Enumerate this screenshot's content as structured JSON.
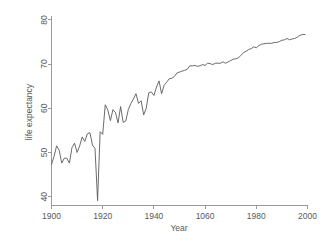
{
  "chart_data": {
    "type": "line",
    "title": "",
    "xlabel": "Year",
    "ylabel": "life expectancy",
    "xlim": [
      1900,
      2000
    ],
    "ylim": [
      38,
      81
    ],
    "grid": false,
    "legend": null,
    "xticks": [
      1900,
      1920,
      1940,
      1960,
      1980,
      2000
    ],
    "xticklabels": [
      "1900",
      "1920",
      "1940",
      "1060",
      "1980",
      "2000"
    ],
    "yticks": [
      40,
      50,
      60,
      70,
      80
    ],
    "yticklabels": [
      "40",
      "50",
      "60",
      "70",
      "80"
    ],
    "series": [
      {
        "name": "life expectancy",
        "color": "#5a5a5a",
        "x": [
          1900,
          1901,
          1902,
          1903,
          1904,
          1905,
          1906,
          1907,
          1908,
          1909,
          1910,
          1911,
          1912,
          1913,
          1914,
          1915,
          1916,
          1917,
          1918,
          1919,
          1920,
          1921,
          1922,
          1923,
          1924,
          1925,
          1926,
          1927,
          1928,
          1929,
          1930,
          1931,
          1932,
          1933,
          1934,
          1935,
          1936,
          1937,
          1938,
          1939,
          1940,
          1941,
          1942,
          1943,
          1944,
          1945,
          1946,
          1947,
          1948,
          1949,
          1950,
          1951,
          1952,
          1953,
          1954,
          1955,
          1956,
          1957,
          1958,
          1959,
          1960,
          1961,
          1962,
          1963,
          1964,
          1965,
          1966,
          1967,
          1968,
          1969,
          1970,
          1971,
          1972,
          1973,
          1974,
          1975,
          1976,
          1977,
          1978,
          1979,
          1980,
          1981,
          1982,
          1983,
          1984,
          1985,
          1986,
          1987,
          1988,
          1989,
          1990,
          1991,
          1992,
          1993,
          1994,
          1995,
          1996,
          1997,
          1998,
          1999
        ],
        "values": [
          47.3,
          49.1,
          51.5,
          50.5,
          47.6,
          48.7,
          48.7,
          47.6,
          51.1,
          52.1,
          50.0,
          51.5,
          53.5,
          52.5,
          54.2,
          54.5,
          51.7,
          50.9,
          39.1,
          54.7,
          54.1,
          60.8,
          59.6,
          57.2,
          59.7,
          59.0,
          56.7,
          60.4,
          56.8,
          57.1,
          59.7,
          61.1,
          62.1,
          63.3,
          61.1,
          61.7,
          58.5,
          60.0,
          63.5,
          63.7,
          62.9,
          64.8,
          66.2,
          63.3,
          65.2,
          65.9,
          66.7,
          66.8,
          67.2,
          68.0,
          68.2,
          68.4,
          68.6,
          68.8,
          69.6,
          69.6,
          69.7,
          69.5,
          69.6,
          69.9,
          69.7,
          70.2,
          70.1,
          69.9,
          70.2,
          70.2,
          70.2,
          70.5,
          70.2,
          70.5,
          70.8,
          71.1,
          71.2,
          71.4,
          72.0,
          72.6,
          72.9,
          73.3,
          73.5,
          73.9,
          73.7,
          74.2,
          74.5,
          74.6,
          74.7,
          74.7,
          74.7,
          74.9,
          74.9,
          75.1,
          75.4,
          75.5,
          75.8,
          75.5,
          75.7,
          75.8,
          76.1,
          76.5,
          76.7,
          76.7
        ]
      }
    ]
  }
}
